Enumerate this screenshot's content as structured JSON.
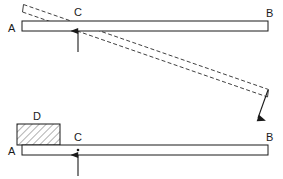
{
  "figure": {
    "background_color": "#ffffff",
    "line_color": "#1a1a1a",
    "beam_fill": "#ffffff",
    "hatch_color": "#555555",
    "dashed_color": "#2a2a2a"
  },
  "diagrams": [
    {
      "id": "top-diagram",
      "name": "beam-rotating-about-fulcrum",
      "labels": {
        "left_end": "A",
        "fulcrum": "C",
        "right_end": "B"
      },
      "elements": {
        "beam": "horizontal-beam",
        "fulcrum_arrow": "upward-fulcrum-arrow",
        "rotated_beam": "dashed-rotated-beam",
        "motion_arrow": "downward-motion-arrow"
      }
    },
    {
      "id": "bottom-diagram",
      "name": "beam-with-block-at-left-end",
      "labels": {
        "left_end": "A",
        "block": "D",
        "fulcrum": "C",
        "right_end": "B"
      },
      "elements": {
        "beam": "horizontal-beam",
        "block": "hatched-block-D",
        "fulcrum_arrow": "upward-fulcrum-arrow",
        "pivot_dot": "pivot-point-dot"
      }
    }
  ]
}
